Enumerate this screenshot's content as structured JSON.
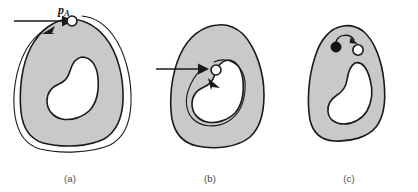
{
  "figure": {
    "background_color": "#ffffff",
    "width": 418,
    "height": 192
  },
  "style": {
    "region_fill": "#c9c9c9",
    "region_stroke": "#1a1a1a",
    "hole_fill": "#ffffff",
    "path_stroke": "#1a1a1a",
    "marker_open_fill": "#ffffff",
    "marker_filled_fill": "#111111",
    "caption_color": "#4a4a4a"
  },
  "panels": [
    {
      "id": "a",
      "caption": "(a)",
      "region_name": "gray-region",
      "hole_name": "interior-hole",
      "start_point": {
        "label_main": "p",
        "label_sub": "A",
        "marker": "open-circle",
        "name": "start-point-pa"
      },
      "annotations": [
        {
          "name": "entry-arrow",
          "type": "straight-arrow",
          "direction": "right"
        },
        {
          "name": "exterior-trace-path",
          "type": "closed-curve",
          "description": "outer boundary-following path around region"
        },
        {
          "name": "trace-direction-arrow",
          "type": "arrowhead",
          "direction": "upper-right"
        }
      ]
    },
    {
      "id": "b",
      "caption": "(b)",
      "region_name": "gray-region",
      "hole_name": "interior-hole",
      "start_point": {
        "label_main": "p",
        "label_sub": "B",
        "marker": "open-circle",
        "name": "start-point-pb"
      },
      "annotations": [
        {
          "name": "entry-arrow",
          "type": "straight-arrow",
          "direction": "right"
        },
        {
          "name": "interior-trace-path",
          "type": "closed-curve",
          "description": "hole boundary-following path inside region"
        },
        {
          "name": "trace-direction-arrow",
          "type": "arrowhead",
          "direction": "down-right"
        }
      ]
    },
    {
      "id": "c",
      "caption": "(c)",
      "region_name": "gray-region",
      "hole_name": "interior-hole",
      "annotations": [
        {
          "name": "filled-point-marker",
          "type": "filled-circle",
          "description": "visited / background point"
        },
        {
          "name": "open-point-marker",
          "type": "open-circle",
          "description": "current boundary point"
        },
        {
          "name": "connector-arc-arrow",
          "type": "curved-arrow",
          "description": "short arc from filled point to open point"
        }
      ]
    }
  ]
}
